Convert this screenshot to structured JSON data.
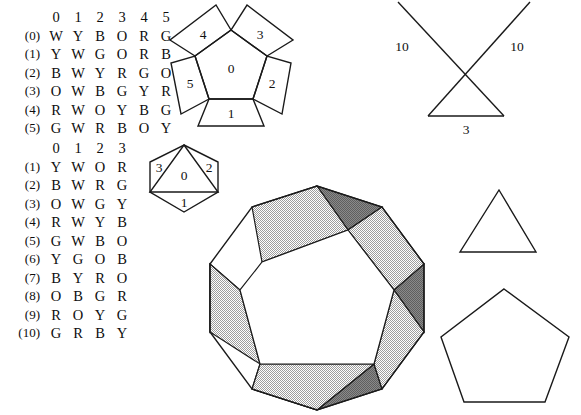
{
  "table_one": {
    "name": "face-color-table-1",
    "column_headers": [
      "0",
      "1",
      "2",
      "3",
      "4",
      "5"
    ],
    "rows": [
      {
        "label": "(0)",
        "cells": [
          "W",
          "Y",
          "B",
          "O",
          "R",
          "G"
        ]
      },
      {
        "label": "(1)",
        "cells": [
          "Y",
          "W",
          "G",
          "O",
          "R",
          "B"
        ]
      },
      {
        "label": "(2)",
        "cells": [
          "B",
          "W",
          "Y",
          "R",
          "G",
          "O"
        ]
      },
      {
        "label": "(3)",
        "cells": [
          "O",
          "W",
          "B",
          "G",
          "Y",
          "R"
        ]
      },
      {
        "label": "(4)",
        "cells": [
          "R",
          "W",
          "O",
          "Y",
          "B",
          "G"
        ]
      },
      {
        "label": "(5)",
        "cells": [
          "G",
          "W",
          "R",
          "B",
          "O",
          "Y"
        ]
      }
    ]
  },
  "table_two": {
    "name": "face-color-table-2",
    "column_headers": [
      "0",
      "1",
      "2",
      "3"
    ],
    "rows": [
      {
        "label": "(1)",
        "cells": [
          "Y",
          "W",
          "O",
          "R"
        ]
      },
      {
        "label": "(2)",
        "cells": [
          "B",
          "W",
          "R",
          "G"
        ]
      },
      {
        "label": "(3)",
        "cells": [
          "O",
          "W",
          "G",
          "Y"
        ]
      },
      {
        "label": "(4)",
        "cells": [
          "R",
          "W",
          "Y",
          "B"
        ]
      },
      {
        "label": "(5)",
        "cells": [
          "G",
          "W",
          "B",
          "O"
        ]
      },
      {
        "label": "(6)",
        "cells": [
          "Y",
          "G",
          "O",
          "B"
        ]
      },
      {
        "label": "(7)",
        "cells": [
          "B",
          "Y",
          "R",
          "O"
        ]
      },
      {
        "label": "(8)",
        "cells": [
          "O",
          "B",
          "G",
          "R"
        ]
      },
      {
        "label": "(9)",
        "cells": [
          "R",
          "O",
          "Y",
          "G"
        ]
      },
      {
        "label": "(10)",
        "cells": [
          "G",
          "R",
          "B",
          "Y"
        ]
      }
    ]
  },
  "pentagon_net": {
    "center_label": "0",
    "flap_labels": [
      "1",
      "2",
      "3",
      "4",
      "5"
    ]
  },
  "hexagon_net": {
    "center_label": "0",
    "flap_labels": [
      "1",
      "2",
      "3"
    ]
  },
  "x_triangle": {
    "side_label_left": "10",
    "side_label_right": "10",
    "base_label": "3"
  },
  "decagon": {
    "fill_light": "#d2d2d2",
    "fill_dark": "#8f8f8f",
    "fill_center": "#ffffff",
    "stroke": "#1a1a1a"
  },
  "plain_triangle": {},
  "plain_pentagon": {}
}
